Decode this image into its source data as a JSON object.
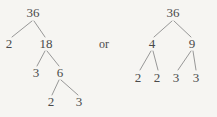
{
  "figure": {
    "kind": "factor-tree-pair",
    "separator_label": "or",
    "ink_color": "#4a4a4a",
    "line_color": "#8c8c8c",
    "background_color": "#f6f5f2"
  },
  "left_tree": {
    "name": "factor-tree-left",
    "root_label": "36",
    "nodes": {
      "root": "36",
      "l1_left": "2",
      "l1_right": "18",
      "l2_left": "3",
      "l2_right": "6",
      "l3_left": "2",
      "l3_right": "3"
    },
    "leaf_factors": [
      "2",
      "3",
      "2",
      "3"
    ],
    "positions": {
      "root": {
        "x": 33,
        "y": 12
      },
      "l1_left": {
        "x": 9,
        "y": 43
      },
      "l1_right": {
        "x": 46,
        "y": 43
      },
      "l2_left": {
        "x": 36,
        "y": 72
      },
      "l2_right": {
        "x": 60,
        "y": 72
      },
      "l3_left": {
        "x": 51,
        "y": 101
      },
      "l3_right": {
        "x": 79,
        "y": 101
      }
    }
  },
  "right_tree": {
    "name": "factor-tree-right",
    "root_label": "36",
    "nodes": {
      "root": "36",
      "l1_left": "4",
      "l1_right": "9",
      "l2_a": "2",
      "l2_b": "2",
      "l2_c": "3",
      "l2_d": "3"
    },
    "leaf_factors": [
      "2",
      "2",
      "3",
      "3"
    ],
    "positions": {
      "root": {
        "x": 173,
        "y": 12
      },
      "l1_left": {
        "x": 152,
        "y": 43
      },
      "l1_right": {
        "x": 192,
        "y": 43
      },
      "l2_a": {
        "x": 138,
        "y": 77
      },
      "l2_b": {
        "x": 157,
        "y": 77
      },
      "l2_c": {
        "x": 176,
        "y": 77
      },
      "l2_d": {
        "x": 196,
        "y": 77
      }
    }
  },
  "separator": {
    "label": "or",
    "position": {
      "x": 104,
      "y": 44
    }
  }
}
